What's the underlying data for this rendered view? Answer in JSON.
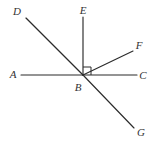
{
  "figure": {
    "width": 154,
    "height": 145,
    "background_color": "#ffffff",
    "stroke_color": "#2b2b2b",
    "label_color": "#333333"
  },
  "vertex": {
    "name": "B",
    "label": "B",
    "x": 83,
    "y": 75
  },
  "labels": [
    {
      "id": "label-a",
      "text": "A",
      "x": 13,
      "y": 74
    },
    {
      "id": "label-b",
      "text": "B",
      "x": 78,
      "y": 87
    },
    {
      "id": "label-c",
      "text": "C",
      "x": 143,
      "y": 75
    },
    {
      "id": "label-d",
      "text": "D",
      "x": 17,
      "y": 11
    },
    {
      "id": "label-e",
      "text": "E",
      "x": 83,
      "y": 10
    },
    {
      "id": "label-f",
      "text": "F",
      "x": 139,
      "y": 45
    },
    {
      "id": "label-g",
      "text": "G",
      "x": 141,
      "y": 132
    }
  ],
  "rays": [
    {
      "id": "ray-ba",
      "from": "B",
      "to": "A",
      "x1": 83,
      "y1": 75,
      "x2": 21,
      "y2": 75
    },
    {
      "id": "ray-bc",
      "from": "B",
      "to": "C",
      "x1": 83,
      "y1": 75,
      "x2": 137,
      "y2": 75
    },
    {
      "id": "ray-bd",
      "from": "B",
      "to": "D",
      "x1": 83,
      "y1": 75,
      "x2": 26,
      "y2": 18
    },
    {
      "id": "ray-be",
      "from": "B",
      "to": "E",
      "x1": 83,
      "y1": 75,
      "x2": 83,
      "y2": 17
    },
    {
      "id": "ray-bf",
      "from": "B",
      "to": "F",
      "x1": 83,
      "y1": 75,
      "x2": 133,
      "y2": 51
    },
    {
      "id": "ray-bg",
      "from": "B",
      "to": "G",
      "x1": 83,
      "y1": 75,
      "x2": 134,
      "y2": 128
    }
  ],
  "right_angle_marker": {
    "id": "right-angle-ebf",
    "between": "EBF",
    "points": "83,67 91,67 91,75"
  }
}
